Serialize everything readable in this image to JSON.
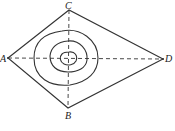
{
  "diagram": {
    "type": "contour-kite",
    "points": {
      "A": {
        "label": "A",
        "x": 8,
        "y": 58
      },
      "B": {
        "label": "B",
        "x": 68,
        "y": 108
      },
      "C": {
        "label": "C",
        "x": 69,
        "y": 10
      },
      "D": {
        "label": "D",
        "x": 163,
        "y": 59
      }
    },
    "center": {
      "x": 69,
      "y": 59
    },
    "contour_count": 3,
    "stroke_color": "#333333"
  }
}
